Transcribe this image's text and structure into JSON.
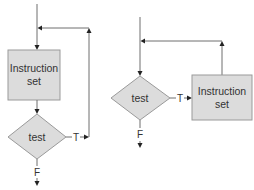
{
  "diagrams": [
    {
      "name": "post-test loop",
      "process_box": {
        "line1": "Instruction",
        "line2": "set"
      },
      "decision": {
        "label": "test"
      },
      "true_label": "T",
      "false_label": "F"
    },
    {
      "name": "pre-test loop",
      "process_box": {
        "line1": "Instruction",
        "line2": "set"
      },
      "decision": {
        "label": "test"
      },
      "true_label": "T",
      "false_label": "F"
    }
  ],
  "colors": {
    "shape_fill": "#dcdcdc",
    "shape_stroke": "#9a9a9a",
    "line": "#6f6f6f",
    "arrowhead": "#222222",
    "text": "#333333"
  }
}
